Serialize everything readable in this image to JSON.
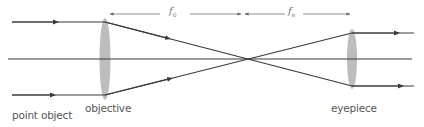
{
  "diagram": {
    "colors": {
      "ray": "#3a3a3a",
      "lens": "#b8b8b8",
      "dimension": "#666666",
      "label": "#555555"
    },
    "labels": {
      "point_object": "point object",
      "objective": "objective",
      "eyepiece": "eyepiece",
      "f_objective_main": "f",
      "f_objective_sub": "0",
      "f_eyepiece_main": "f",
      "f_eyepiece_sub": "e"
    },
    "geometry": {
      "axis_y": 59,
      "objective_x": 105,
      "eyepiece_x": 352,
      "focal_point_x": 245,
      "ray_top_y": 22,
      "ray_bottom_y": 95,
      "eyepiece_top_y": 33,
      "eyepiece_bottom_y": 86,
      "dimension_y": 14
    }
  }
}
